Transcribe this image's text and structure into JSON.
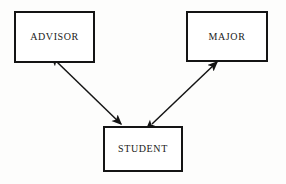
{
  "diagram": {
    "type": "entity-relationship",
    "background_color": "#fdfdfc",
    "line_color": "#141414",
    "text_color": "#1a1a1a",
    "entities": [
      {
        "id": "advisor",
        "label": "ADVISOR",
        "x": 14,
        "y": 11,
        "width": 81,
        "height": 52
      },
      {
        "id": "major",
        "label": "MAJOR",
        "x": 186,
        "y": 11,
        "width": 82,
        "height": 51
      },
      {
        "id": "student",
        "label": "STUDENT",
        "x": 103,
        "y": 126,
        "width": 80,
        "height": 46
      }
    ],
    "relationships": [
      {
        "id": "advisor-student",
        "from": "advisor",
        "to": "student",
        "style": "double-headed-arrow",
        "label": "",
        "x1": 57,
        "y1": 62,
        "x2": 121,
        "y2": 124
      },
      {
        "id": "major-student",
        "from": "student",
        "to": "major",
        "style": "double-headed-arrow",
        "label": "",
        "x1": 152,
        "y1": 124,
        "x2": 217,
        "y2": 62
      }
    ]
  }
}
